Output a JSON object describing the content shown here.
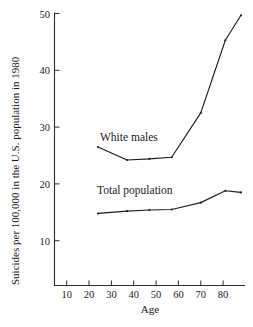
{
  "figure": {
    "name": "suicide-rate-by-age-line-chart",
    "background_color": "#ffffff",
    "ink_color": "#1d1d1d"
  },
  "chart_data": {
    "type": "line",
    "title": "",
    "xlabel": "Age",
    "ylabel": "Suicides per 100,000 in the U.S. population in 1980",
    "xlim": [
      5,
      90
    ],
    "ylim": [
      0,
      50
    ],
    "xticks": [
      10,
      20,
      30,
      40,
      50,
      60,
      70,
      80
    ],
    "xtick_labels": [
      "10",
      "20",
      "30",
      "40",
      "50",
      "60",
      "70",
      "80"
    ],
    "yticks": [
      10,
      20,
      30,
      40,
      50
    ],
    "ytick_labels": [
      "10",
      "20",
      "30",
      "40",
      "50"
    ],
    "grid": false,
    "legend": "inline-annotations",
    "series": [
      {
        "name": "White males",
        "label_position": "above-line",
        "x": [
          24,
          37,
          47,
          57,
          70,
          81,
          88
        ],
        "values": [
          26.5,
          24.2,
          24.4,
          24.7,
          32.5,
          45.3,
          49.7
        ]
      },
      {
        "name": "Total population",
        "label_position": "above-line",
        "x": [
          24,
          37,
          47,
          57,
          70,
          81,
          88
        ],
        "values": [
          14.8,
          15.2,
          15.4,
          15.5,
          16.7,
          18.8,
          18.5
        ]
      }
    ],
    "annotations": [
      {
        "text": "White males",
        "x": 42,
        "y": 28.5
      },
      {
        "text": "Total population",
        "x": 41,
        "y": 20.0
      }
    ]
  },
  "axis": {
    "x_title": "Age",
    "y_title": "Suicides per 100,000 in the U.S. population in 1980"
  }
}
